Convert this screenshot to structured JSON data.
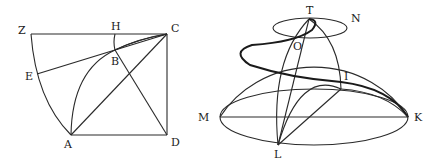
{
  "figures": [
    {
      "id": "quadratrix",
      "labels": {
        "Z": "Z",
        "H": "H",
        "C": "C",
        "B": "B",
        "E": "E",
        "A": "A",
        "D": "D"
      }
    },
    {
      "id": "hemisphere-spiral",
      "labels": {
        "T": "T",
        "N": "N",
        "O": "O",
        "I": "I",
        "M": "M",
        "K": "K",
        "L": "L"
      }
    }
  ]
}
